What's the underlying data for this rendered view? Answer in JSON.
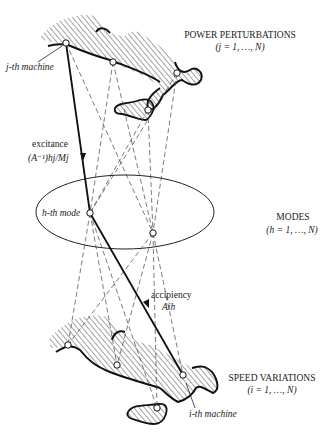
{
  "diagram": {
    "top_group": {
      "title": "POWER PERTURBATIONS",
      "range": "(j = 1, …, N)",
      "machine_label": "j-th machine"
    },
    "middle_group": {
      "title": "MODES",
      "range": "(h = 1, …, N)",
      "mode_label": "h-th mode"
    },
    "bottom_group": {
      "title": "SPEED VARIATIONS",
      "range": "(i = 1, …, N)",
      "machine_label": "i-th machine"
    },
    "arrows": {
      "excitance_label": "excitance",
      "excitance_formula": "(A⁻¹)hj/Mj",
      "accipiency_label": "accipiency",
      "accipiency_formula": "Aih"
    },
    "colors": {
      "ink": "#1a1a1a",
      "hatch": "#333333",
      "background": "#ffffff"
    }
  }
}
